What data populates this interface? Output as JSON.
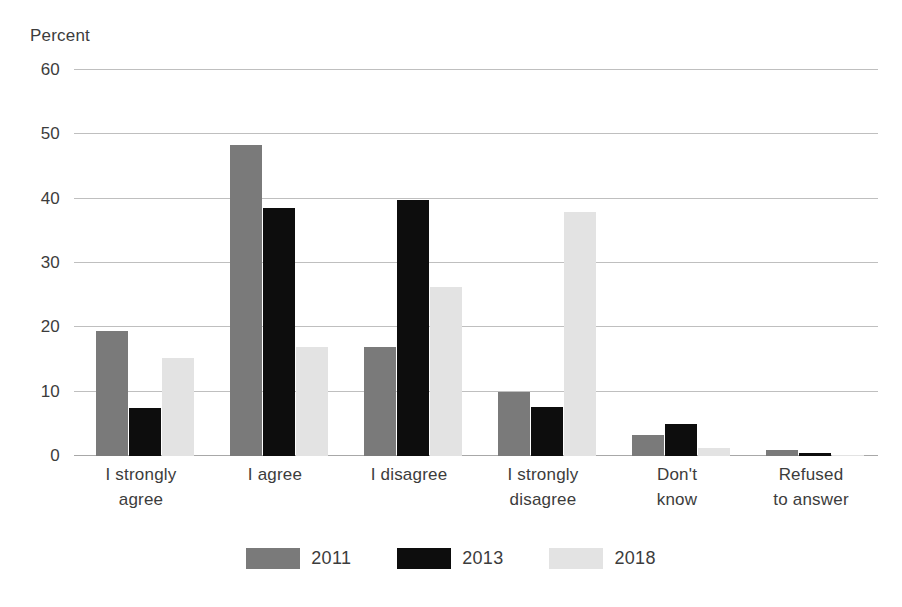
{
  "chart_data": {
    "type": "bar",
    "title": "",
    "subtitle": "",
    "xlabel": "",
    "ylabel": "Percent",
    "ylim": [
      0,
      60
    ],
    "yticks": [
      0,
      10,
      20,
      30,
      40,
      50,
      60
    ],
    "grid": true,
    "legend_position": "bottom",
    "categories": [
      "I strongly agree",
      "I agree",
      "I disagree",
      "I strongly disagree",
      "Don't know",
      "Refused to answer"
    ],
    "category_lines": [
      [
        "I strongly",
        "agree"
      ],
      [
        "I agree"
      ],
      [
        "I disagree"
      ],
      [
        "I strongly",
        "disagree"
      ],
      [
        "Don't",
        "know"
      ],
      [
        "Refused",
        "to answer"
      ]
    ],
    "series": [
      {
        "name": "2011",
        "color": "#7a7a7a",
        "values": [
          19.4,
          48.3,
          17.0,
          10.0,
          3.2,
          1.0
        ]
      },
      {
        "name": "2013",
        "color": "#0d0d0d",
        "values": [
          7.4,
          38.5,
          39.8,
          7.6,
          5.0,
          0.5
        ]
      },
      {
        "name": "2018",
        "color": "#e3e3e3",
        "values": [
          15.3,
          17.0,
          26.3,
          37.9,
          1.2,
          0.1
        ]
      }
    ]
  },
  "colors": {
    "text": "#3c3c3c",
    "gridline": "#bfbfbf",
    "baseline": "#a8a8a8",
    "background": "#ffffff"
  }
}
